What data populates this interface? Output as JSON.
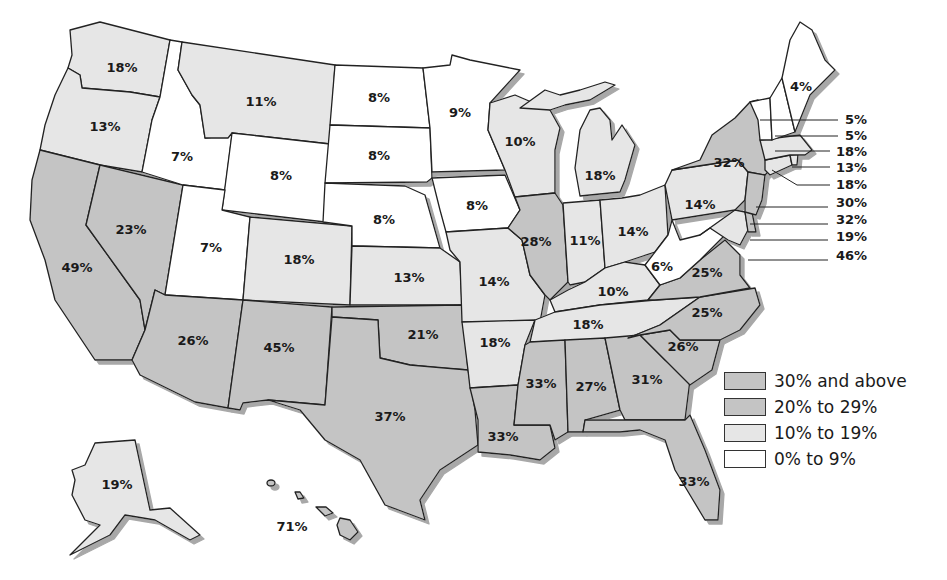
{
  "map": {
    "title": "",
    "type": "choropleth",
    "region": "United States",
    "shadow_color": "#a8a8a8",
    "border_color": "#222222"
  },
  "legend": {
    "items": [
      {
        "label": "30% and above",
        "color": "#c4c4c4",
        "class": "c30"
      },
      {
        "label": "20% to 29%",
        "color": "#c4c4c4",
        "class": "c20"
      },
      {
        "label": "10% to 19%",
        "color": "#e6e6e6",
        "class": "c10"
      },
      {
        "label": "0% to 9%",
        "color": "#ffffff",
        "class": "c0"
      }
    ]
  },
  "states": {
    "WA": {
      "value": "18%"
    },
    "OR": {
      "value": "13%"
    },
    "CA": {
      "value": "49%"
    },
    "ID": {
      "value": "7%"
    },
    "NV": {
      "value": "23%"
    },
    "MT": {
      "value": "11%"
    },
    "WY": {
      "value": "8%"
    },
    "UT": {
      "value": "7%"
    },
    "AZ": {
      "value": "26%"
    },
    "CO": {
      "value": "18%"
    },
    "NM": {
      "value": "45%"
    },
    "ND": {
      "value": "8%"
    },
    "SD": {
      "value": "8%"
    },
    "NE": {
      "value": "8%"
    },
    "KS": {
      "value": "13%"
    },
    "OK": {
      "value": "21%"
    },
    "TX": {
      "value": "37%"
    },
    "MN": {
      "value": "9%"
    },
    "IA": {
      "value": "8%"
    },
    "MO": {
      "value": "14%"
    },
    "AR": {
      "value": "18%"
    },
    "LA": {
      "value": "33%"
    },
    "WI": {
      "value": "10%"
    },
    "IL": {
      "value": "28%"
    },
    "MI": {
      "value": "18%"
    },
    "IN": {
      "value": "11%"
    },
    "OH": {
      "value": "14%"
    },
    "KY": {
      "value": "10%"
    },
    "TN": {
      "value": "18%"
    },
    "MS": {
      "value": "33%"
    },
    "AL": {
      "value": "27%"
    },
    "GA": {
      "value": "31%"
    },
    "FL": {
      "value": "33%"
    },
    "SC": {
      "value": "26%"
    },
    "NC": {
      "value": "25%"
    },
    "VA": {
      "value": "25%"
    },
    "WV": {
      "value": "6%"
    },
    "PA": {
      "value": "14%"
    },
    "NY": {
      "value": "32%"
    },
    "ME": {
      "value": "4%"
    },
    "AK": {
      "value": "19%"
    },
    "HI": {
      "value": "71%"
    }
  },
  "callouts": [
    {
      "state": "VT",
      "value": "5%"
    },
    {
      "state": "NH",
      "value": "5%"
    },
    {
      "state": "MA",
      "value": "18%"
    },
    {
      "state": "RI",
      "value": "13%"
    },
    {
      "state": "CT",
      "value": "18%"
    },
    {
      "state": "NJ",
      "value": "30%"
    },
    {
      "state": "DE",
      "value": "32%"
    },
    {
      "state": "MD",
      "value": "19%"
    },
    {
      "state": "DC",
      "value": "46%"
    }
  ]
}
